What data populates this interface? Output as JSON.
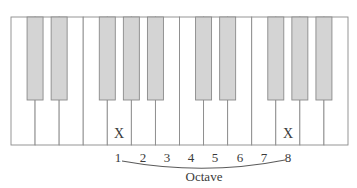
{
  "diagram": {
    "type": "piano-keyboard",
    "white_key_count": 14,
    "black_key_count": 10,
    "colors": {
      "white_key": "#ffffff",
      "black_key": "#d4d4d4",
      "outline": "#8a8a8a",
      "text": "#3a3a3a"
    },
    "marked_keys": [
      {
        "white_index": 4,
        "mark": "X"
      },
      {
        "white_index": 11,
        "mark": "X"
      }
    ],
    "numbers": [
      "1",
      "2",
      "3",
      "4",
      "5",
      "6",
      "7",
      "8"
    ],
    "bracket_label": "Octave"
  }
}
